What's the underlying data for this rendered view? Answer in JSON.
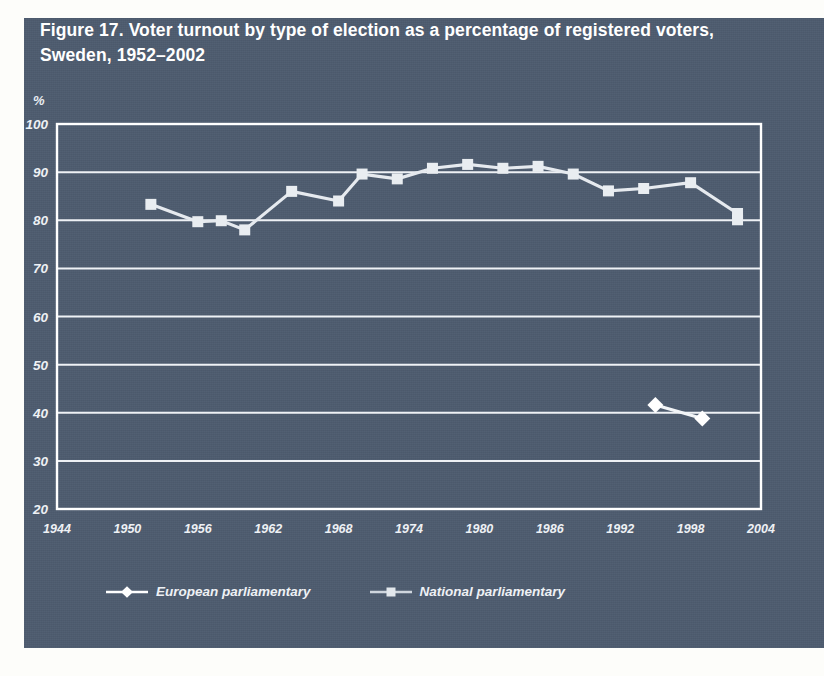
{
  "figure": {
    "title": "Figure 17. Voter turnout by type of election as a percentage of registered voters, Sweden, 1952–2002",
    "panel_color": "#4d5b6e",
    "ink_color": "#ffffff"
  },
  "chart_data": {
    "type": "line",
    "title": "Figure 17. Voter turnout by type of election as a percentage of registered voters, Sweden, 1952–2002",
    "xlabel": "",
    "ylabel": "%",
    "xlim": [
      1944,
      2004
    ],
    "ylim": [
      20,
      100
    ],
    "yticks": [
      20,
      30,
      40,
      50,
      60,
      70,
      80,
      90,
      100
    ],
    "xticks": [
      1944,
      1950,
      1956,
      1962,
      1968,
      1974,
      1980,
      1986,
      1992,
      1998,
      2004
    ],
    "grid": "horizontal",
    "legend_position": "below",
    "series": [
      {
        "name": "European parliamentary",
        "marker": "diamond",
        "x": [
          1995,
          1999
        ],
        "values": [
          41.6,
          38.8
        ]
      },
      {
        "name": "National parliamentary",
        "marker": "square",
        "x": [
          1952,
          1956,
          1958,
          1960,
          1964,
          1968,
          1970,
          1973,
          1976,
          1979,
          1982,
          1985,
          1988,
          1991,
          1994,
          1998,
          2002
        ],
        "values": [
          83.3,
          79.7,
          79.9,
          78.0,
          86.0,
          84.0,
          89.6,
          88.6,
          90.8,
          91.6,
          90.8,
          91.2,
          89.6,
          86.1,
          86.6,
          87.8,
          81.4
        ]
      }
    ],
    "series_extra_note": {
      "national_last_point_year": 2002,
      "national_last_point_value": 80.1
    }
  },
  "axes": {
    "unit_label": "%",
    "y_tick_labels": [
      "100",
      "90",
      "80",
      "70",
      "60",
      "50",
      "40",
      "30",
      "20"
    ],
    "x_tick_labels": [
      "1944",
      "1950",
      "1956",
      "1962",
      "1968",
      "1974",
      "1980",
      "1986",
      "1992",
      "1998",
      "2004"
    ]
  },
  "legend": {
    "items": [
      {
        "label": "European parliamentary",
        "marker": "diamond-marker-icon"
      },
      {
        "label": "National parliamentary",
        "marker": "square-marker-icon"
      }
    ]
  }
}
